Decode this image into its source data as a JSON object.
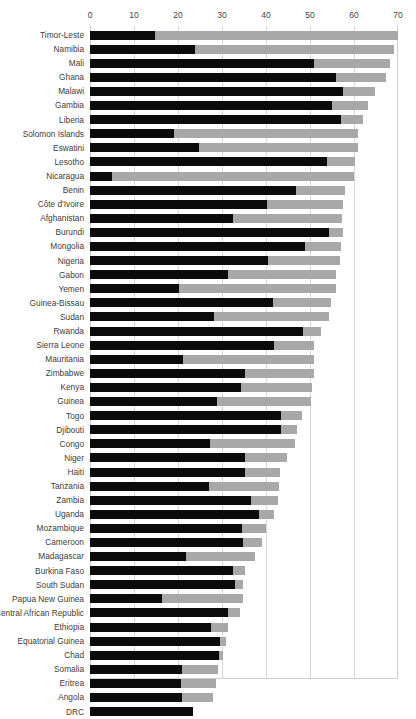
{
  "chart_data": {
    "type": "bar",
    "orientation": "horizontal",
    "stacked": true,
    "title": "",
    "subtitle": "",
    "xlabel": "",
    "ylabel": "",
    "xlim": [
      0,
      70
    ],
    "xticks": [
      0,
      10,
      20,
      30,
      40,
      50,
      60,
      70
    ],
    "xtick_labels": [
      "0",
      "10",
      "20",
      "30",
      "40",
      "50",
      "60",
      "70"
    ],
    "grid": true,
    "axis_position": "top",
    "legend": null,
    "colors": {
      "segment1": "#0b0b0b",
      "segment2": "#a8a8a8",
      "grid": "#d7d7d7",
      "frame": "#cfcfcf"
    },
    "series": [
      {
        "name": "segment-1",
        "color": "#0b0b0b"
      },
      {
        "name": "segment-2",
        "color": "#a8a8a8"
      }
    ],
    "categories": [
      "Timor-Leste",
      "Namibia",
      "Mali",
      "Ghana",
      "Malawi",
      "Gambia",
      "Liberia",
      "Solomon Islands",
      "Eswatini",
      "Lesotho",
      "Nicaragua",
      "Benin",
      "Côte d'Ivoire",
      "Afghanistan",
      "Burundi",
      "Mongolia",
      "Nigeria",
      "Gabon",
      "Yemen",
      "Guinea-Bissau",
      "Sudan",
      "Rwanda",
      "Sierra Leone",
      "Mauritania",
      "Zimbabwe",
      "Kenya",
      "Guinea",
      "Togo",
      "Djibouti",
      "Congo",
      "Niger",
      "Haiti",
      "Tanzania",
      "Zambia",
      "Uganda",
      "Mozambique",
      "Cameroon",
      "Madagascar",
      "Burkina Faso",
      "South Sudan",
      "Papua New Guinea",
      "Central African Republic",
      "Ethiopia",
      "Equatorial Guinea",
      "Chad",
      "Somalia",
      "Eritrea",
      "Angola",
      "DRC"
    ],
    "rows": [
      {
        "label": "Timor-Leste",
        "v1": 14.8,
        "total": 70.0
      },
      {
        "label": "Namibia",
        "v1": 23.8,
        "total": 69.2
      },
      {
        "label": "Mali",
        "v1": 50.8,
        "total": 68.2
      },
      {
        "label": "Ghana",
        "v1": 56.0,
        "total": 67.2
      },
      {
        "label": "Malawi",
        "v1": 57.6,
        "total": 64.8
      },
      {
        "label": "Gambia",
        "v1": 55.0,
        "total": 63.2
      },
      {
        "label": "Liberia",
        "v1": 57.0,
        "total": 62.0
      },
      {
        "label": "Solomon Islands",
        "v1": 19.0,
        "total": 61.0
      },
      {
        "label": "Eswatini",
        "v1": 24.8,
        "total": 61.0
      },
      {
        "label": "Lesotho",
        "v1": 53.8,
        "total": 60.2
      },
      {
        "label": "Nicaragua",
        "v1": 5.0,
        "total": 60.0
      },
      {
        "label": "Benin",
        "v1": 46.8,
        "total": 58.0
      },
      {
        "label": "Côte d'Ivoire",
        "v1": 40.2,
        "total": 57.6
      },
      {
        "label": "Afghanistan",
        "v1": 32.4,
        "total": 57.2
      },
      {
        "label": "Burundi",
        "v1": 54.4,
        "total": 57.4
      },
      {
        "label": "Mongolia",
        "v1": 48.8,
        "total": 57.0
      },
      {
        "label": "Nigeria",
        "v1": 40.4,
        "total": 56.8
      },
      {
        "label": "Gabon",
        "v1": 31.4,
        "total": 56.0
      },
      {
        "label": "Yemen",
        "v1": 20.2,
        "total": 55.8
      },
      {
        "label": "Guinea-Bissau",
        "v1": 41.6,
        "total": 54.8
      },
      {
        "label": "Sudan",
        "v1": 28.2,
        "total": 54.4
      },
      {
        "label": "Rwanda",
        "v1": 48.4,
        "total": 52.4
      },
      {
        "label": "Sierra Leone",
        "v1": 41.8,
        "total": 51.0
      },
      {
        "label": "Mauritania",
        "v1": 21.2,
        "total": 51.0
      },
      {
        "label": "Zimbabwe",
        "v1": 35.2,
        "total": 50.8
      },
      {
        "label": "Kenya",
        "v1": 34.4,
        "total": 50.4
      },
      {
        "label": "Guinea",
        "v1": 28.8,
        "total": 50.2
      },
      {
        "label": "Togo",
        "v1": 43.4,
        "total": 48.2
      },
      {
        "label": "Djibouti",
        "v1": 43.4,
        "total": 47.0
      },
      {
        "label": "Congo",
        "v1": 27.2,
        "total": 46.6
      },
      {
        "label": "Niger",
        "v1": 35.2,
        "total": 44.8
      },
      {
        "label": "Haiti",
        "v1": 35.2,
        "total": 43.2
      },
      {
        "label": "Tanzania",
        "v1": 27.0,
        "total": 43.0
      },
      {
        "label": "Zambia",
        "v1": 36.6,
        "total": 42.8
      },
      {
        "label": "Uganda",
        "v1": 38.4,
        "total": 41.8
      },
      {
        "label": "Mozambique",
        "v1": 34.6,
        "total": 40.0
      },
      {
        "label": "Cameroon",
        "v1": 34.8,
        "total": 39.2
      },
      {
        "label": "Madagascar",
        "v1": 21.8,
        "total": 37.4
      },
      {
        "label": "Burkina Faso",
        "v1": 32.6,
        "total": 35.2
      },
      {
        "label": "South Sudan",
        "v1": 33.0,
        "total": 34.8
      },
      {
        "label": "Papua New Guinea",
        "v1": 16.4,
        "total": 34.8
      },
      {
        "label": "Central African Republic",
        "v1": 31.4,
        "total": 34.2
      },
      {
        "label": "Ethiopia",
        "v1": 27.6,
        "total": 31.4
      },
      {
        "label": "Equatorial Guinea",
        "v1": 29.6,
        "total": 30.8
      },
      {
        "label": "Chad",
        "v1": 29.4,
        "total": 30.2
      },
      {
        "label": "Somalia",
        "v1": 20.8,
        "total": 29.2
      },
      {
        "label": "Eritrea",
        "v1": 20.6,
        "total": 28.6
      },
      {
        "label": "Angola",
        "v1": 20.8,
        "total": 28.0
      },
      {
        "label": "DRC",
        "v1": 23.4,
        "total": 23.4
      }
    ]
  }
}
